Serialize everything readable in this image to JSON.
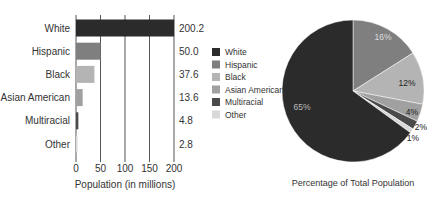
{
  "chart_data": [
    {
      "type": "bar",
      "orientation": "horizontal",
      "title": "",
      "xlabel": "Population (in millions)",
      "ylabel": "",
      "categories": [
        "White",
        "Hispanic",
        "Black",
        "Asian American",
        "Multiracial",
        "Other"
      ],
      "values": [
        200.2,
        50.0,
        37.6,
        13.6,
        4.8,
        2.8
      ],
      "value_labels": [
        "200.2",
        "50.0",
        "37.6",
        "13.6",
        "4.8",
        "2.8"
      ],
      "colors": [
        "#2b2b2b",
        "#7f7f7f",
        "#b4b4b4",
        "#a0a0a0",
        "#4a4a4a",
        "#d9d9d9"
      ],
      "xlim": [
        0,
        200
      ],
      "xticks": [
        0,
        50,
        100,
        150,
        200
      ],
      "grid": true
    },
    {
      "type": "pie",
      "title": "Percentage of Total Population",
      "categories": [
        "White",
        "Hispanic",
        "Black",
        "Asian American",
        "Multiracial",
        "Other"
      ],
      "values": [
        65,
        16,
        12,
        4,
        2,
        1
      ],
      "labels": [
        "65%",
        "16%",
        "12%",
        "4%",
        "2%",
        "1%"
      ],
      "colors": [
        "#2b2b2b",
        "#7f7f7f",
        "#b4b4b4",
        "#a0a0a0",
        "#4a4a4a",
        "#d9d9d9"
      ],
      "legend": {
        "position": "left",
        "entries": [
          "White",
          "Hispanic",
          "Black",
          "Asian American",
          "Multiracial",
          "Other"
        ]
      }
    }
  ]
}
